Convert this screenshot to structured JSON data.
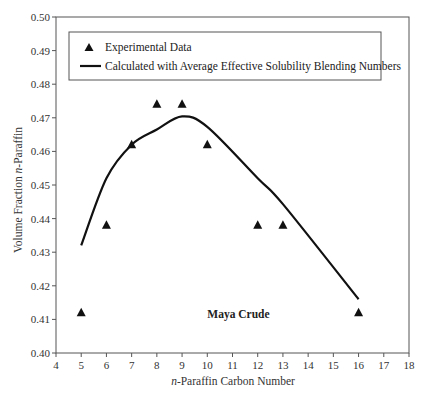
{
  "chart_data": {
    "type": "scatter",
    "title": "",
    "xlabel_prefix": "n",
    "xlabel_rest": "-Paraffin Carbon Number",
    "xlabel": "n-Paraffin Carbon Number",
    "ylabel_prefix": "Volume Fraction ",
    "ylabel_italic": "n",
    "ylabel_rest": "-Paraffin",
    "ylabel": "Volume Fraction n-Paraffin",
    "xlim": [
      4,
      18
    ],
    "ylim": [
      0.4,
      0.5
    ],
    "xticks": [
      4,
      5,
      6,
      7,
      8,
      9,
      10,
      11,
      12,
      13,
      14,
      15,
      16,
      17,
      18
    ],
    "yticks": [
      "0.40",
      "0.41",
      "0.42",
      "0.43",
      "0.44",
      "0.45",
      "0.46",
      "0.47",
      "0.48",
      "0.49",
      "0.50"
    ],
    "grid": false,
    "legend_position": "top-inside",
    "series": [
      {
        "name": "Experimental Data",
        "kind": "scatter",
        "marker": "triangle",
        "x": [
          5,
          6,
          7,
          8,
          9,
          10,
          12,
          13,
          16
        ],
        "y": [
          0.412,
          0.438,
          0.462,
          0.474,
          0.474,
          0.462,
          0.438,
          0.438,
          0.412
        ]
      },
      {
        "name": "Calculated with Average Effective Solubility Blending Numbers",
        "kind": "line",
        "x": [
          5,
          6,
          7,
          8,
          9,
          10,
          12,
          13,
          16
        ],
        "y": [
          0.432,
          0.452,
          0.462,
          0.4665,
          0.4704,
          0.4673,
          0.452,
          0.4443,
          0.416
        ]
      }
    ],
    "annotations": [
      {
        "text": "Maya Crude",
        "x": 10.0,
        "y": 0.4115,
        "bold": true
      }
    ]
  },
  "legend": {
    "items": [
      {
        "label": "Experimental Data",
        "symbol": "triangle"
      },
      {
        "label": "Calculated with Average Effective Solubility Blending Numbers",
        "symbol": "line"
      }
    ]
  },
  "colors": {
    "axis": "#555555",
    "series": "#111111",
    "background": "#ffffff"
  }
}
